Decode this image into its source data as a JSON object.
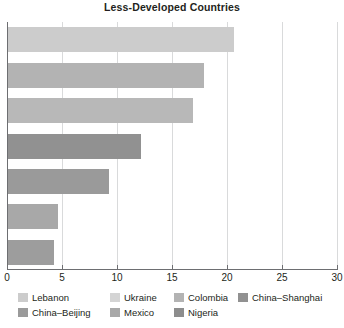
{
  "chart_data": {
    "type": "bar",
    "orientation": "horizontal",
    "title": "Less-Developed Countries",
    "xlabel": "",
    "ylabel": "",
    "xlim": [
      0,
      30
    ],
    "xticks": [
      0,
      5,
      10,
      15,
      20,
      25,
      30
    ],
    "xtick_labels": [
      "0",
      "5",
      "10",
      "15",
      "20",
      "25",
      "30"
    ],
    "grid": true,
    "grid_axis": "x",
    "legend_position": "bottom",
    "categories": [
      "Lebanon",
      "Ukraine",
      "Colombia",
      "China-Shanghai",
      "China-Beijing",
      "Mexico",
      "Nigeria"
    ],
    "values": [
      20.5,
      17.8,
      16.8,
      12.1,
      9.2,
      4.5,
      4.2
    ],
    "colors": [
      "#cccccc",
      "#b3b3b3",
      "#b8b8b8",
      "#919191",
      "#9a9a9a",
      "#a8a8a8",
      "#9d9d9d"
    ],
    "bars": [
      {
        "label": "Lebanon",
        "value": 20.5,
        "color": "#cccccc"
      },
      {
        "label": "Ukraine",
        "value": 17.8,
        "color": "#b3b3b3"
      },
      {
        "label": "Colombia",
        "value": 16.8,
        "color": "#b8b8b8"
      },
      {
        "label": "China-Shanghai",
        "value": 12.1,
        "color": "#919191"
      },
      {
        "label": "China-Beijing",
        "value": 9.2,
        "color": "#9a9a9a"
      },
      {
        "label": "Mexico",
        "value": 4.5,
        "color": "#a8a8a8"
      },
      {
        "label": "Nigeria",
        "value": 4.2,
        "color": "#9d9d9d"
      }
    ],
    "legend": [
      {
        "label": "Lebanon",
        "color": "#cccccc"
      },
      {
        "label": "Ukraine",
        "color": "#d4d4d4"
      },
      {
        "label": "Colombia",
        "color": "#b3b3b3"
      },
      {
        "label": "China–Shanghai",
        "color": "#919191"
      },
      {
        "label": "China–Beijing",
        "color": "#9a9a9a"
      },
      {
        "label": "Mexico",
        "color": "#a8a8a8"
      },
      {
        "label": "Nigeria",
        "color": "#8d8d8d"
      }
    ]
  },
  "axis": {
    "tick_labels": [
      "0",
      "5",
      "10",
      "15",
      "20",
      "25",
      "30"
    ]
  },
  "style": {
    "axis_color": "#6d6e71",
    "grid_color": "#d9dadb",
    "text_color": "#231f20",
    "background": "#ffffff"
  }
}
